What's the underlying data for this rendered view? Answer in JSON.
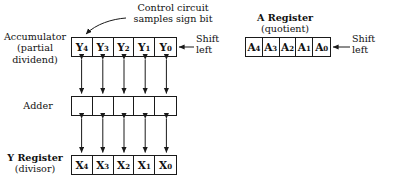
{
  "figure": {
    "background_color": "#ffffff",
    "line_color": "#1a1a1a"
  },
  "annotations": {
    "control_circuit": {
      "line1": "Control circuit",
      "line2": "samples sign bit"
    },
    "shift_left_accumulator": {
      "line1": "Shift",
      "line2": "left"
    },
    "shift_left_a_register": {
      "line1": "Shift",
      "line2": "left"
    }
  },
  "blocks": {
    "accumulator": {
      "label_line1": "Accumulator",
      "label_line2": "(partial",
      "label_line3": "dividend)",
      "cells": [
        {
          "name": "Y",
          "index": "4"
        },
        {
          "name": "Y",
          "index": "3"
        },
        {
          "name": "Y",
          "index": "2"
        },
        {
          "name": "Y",
          "index": "1"
        },
        {
          "name": "Y",
          "index": "0"
        }
      ]
    },
    "adder": {
      "label_line1": "Adder",
      "cells": [
        {
          "name": "",
          "index": ""
        },
        {
          "name": "",
          "index": ""
        },
        {
          "name": "",
          "index": ""
        },
        {
          "name": "",
          "index": ""
        },
        {
          "name": "",
          "index": ""
        }
      ]
    },
    "y_register": {
      "label_line1": "Y Register",
      "label_line2": "(divisor)",
      "cells": [
        {
          "name": "X",
          "index": "4"
        },
        {
          "name": "X",
          "index": "3"
        },
        {
          "name": "X",
          "index": "2"
        },
        {
          "name": "X",
          "index": "1"
        },
        {
          "name": "X",
          "index": "0"
        }
      ]
    },
    "a_register": {
      "label_line1": "A  Register",
      "label_line2": "(quotient)",
      "cells": [
        {
          "name": "A",
          "index": "4"
        },
        {
          "name": "A",
          "index": "3"
        },
        {
          "name": "A",
          "index": "2"
        },
        {
          "name": "A",
          "index": "1"
        },
        {
          "name": "A",
          "index": "0"
        }
      ]
    }
  },
  "connections": {
    "accumulator_to_adder": "bidirectional-bus-5-bit",
    "adder_to_y_register": "bidirectional-bus-5-bit"
  }
}
